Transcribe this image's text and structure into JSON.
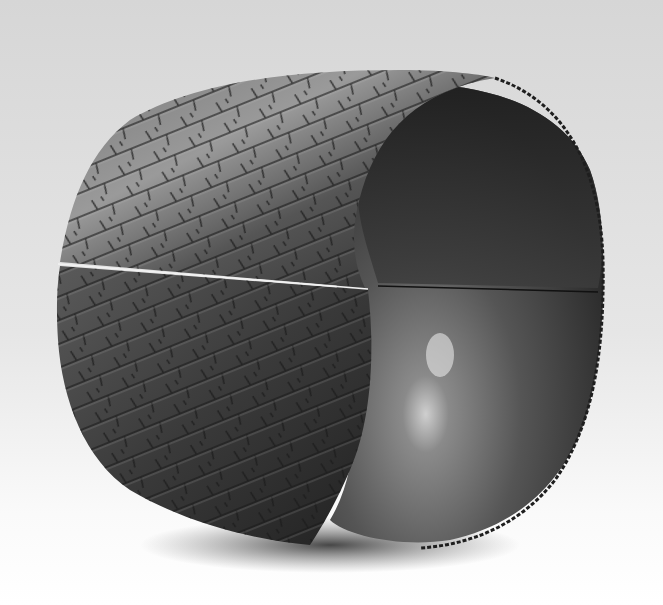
{
  "image": {
    "subject": "textured metal cylinder sculpture",
    "width": 663,
    "height": 605,
    "colors": {
      "background_top": "#d9d9d9",
      "background_bottom": "#ffffff",
      "outer_surface_dark": "#2a2a2a",
      "outer_surface_light": "#8c8c8c",
      "inner_surface": "#4a4a4a",
      "inner_highlight": "#bdbdbd",
      "shadow": "#3a3a3a"
    }
  }
}
